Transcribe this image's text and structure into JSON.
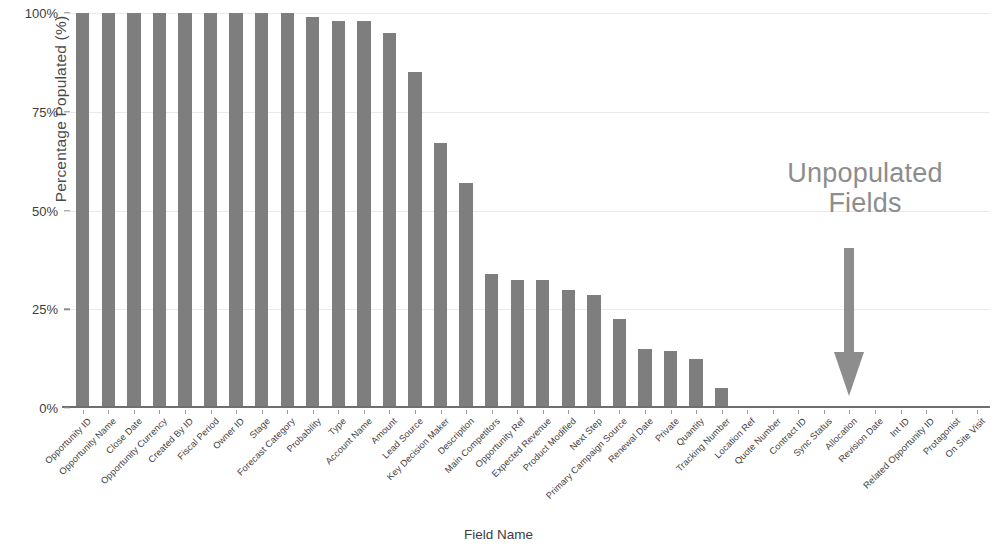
{
  "chart_data": {
    "type": "bar",
    "title": "",
    "xlabel": "Field Name",
    "ylabel": "Percentage Populated (%)",
    "ylim": [
      0,
      100
    ],
    "ytick_labels": [
      "0%",
      "25%",
      "50%",
      "75%",
      "100%"
    ],
    "ytick_values": [
      0,
      25,
      50,
      75,
      100
    ],
    "grid": true,
    "legend": "none",
    "bar_color": "#7e7e7e",
    "categories": [
      "Opportunity ID",
      "Opportunity Name",
      "Close Date",
      "Opportunity Currency",
      "Created By ID",
      "Fiscal Period",
      "Owner ID",
      "Stage",
      "Forecast Category",
      "Probability",
      "Type",
      "Account Name",
      "Amount",
      "Lead Source",
      "Key Decision Maker",
      "Description",
      "Main Competitors",
      "Opportunity Ref",
      "Expected Revenue",
      "Product Modified",
      "Next Step",
      "Primary Campaign Source",
      "Renewal Date",
      "Private",
      "Quantity",
      "Tracking Number",
      "Location Ref",
      "Quote Number",
      "Contract ID",
      "Sync Status",
      "Allocation",
      "Revision Date",
      "Int ID",
      "Related Opportunity ID",
      "Protagonist",
      "On Site Visit"
    ],
    "values": [
      100,
      100,
      100,
      100,
      100,
      100,
      100,
      100,
      100,
      99,
      98,
      98,
      95,
      85,
      67,
      57,
      34,
      32.5,
      32.5,
      30,
      28.5,
      22.5,
      15,
      14.5,
      12.5,
      5,
      0,
      0,
      0,
      0,
      0,
      0,
      0,
      0,
      0,
      0
    ]
  },
  "annotation": {
    "text_line1": "Unpopulated",
    "text_line2": "Fields",
    "arrow_direction": "down",
    "color": "#8d8d8d"
  }
}
